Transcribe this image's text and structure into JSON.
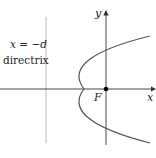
{
  "diagram": {
    "directrix_equation": "x = −d",
    "directrix_label": "directrix",
    "focus_label": "F",
    "x_axis_label": "x",
    "y_axis_label": "y",
    "colors": {
      "axis": "#333333",
      "directrix": "#bbbbbb",
      "curve": "#555555",
      "focus": "#000000"
    }
  }
}
